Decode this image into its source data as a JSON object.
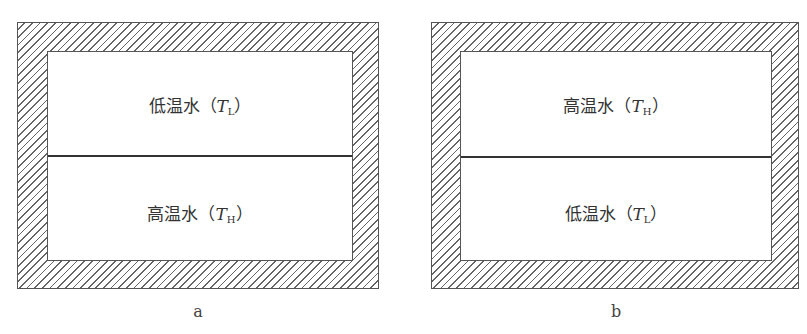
{
  "diagrams": [
    {
      "id": "a",
      "caption": "a",
      "top_label": {
        "text": "低温水（",
        "var": "T",
        "sub": "L",
        "close": "）"
      },
      "bottom_label": {
        "text": "高温水（",
        "var": "T",
        "sub": "H",
        "close": "）"
      }
    },
    {
      "id": "b",
      "caption": "b",
      "top_label": {
        "text": "高温水（",
        "var": "T",
        "sub": "H",
        "close": "）"
      },
      "bottom_label": {
        "text": "低温水（",
        "var": "T",
        "sub": "L",
        "close": "）"
      }
    }
  ]
}
